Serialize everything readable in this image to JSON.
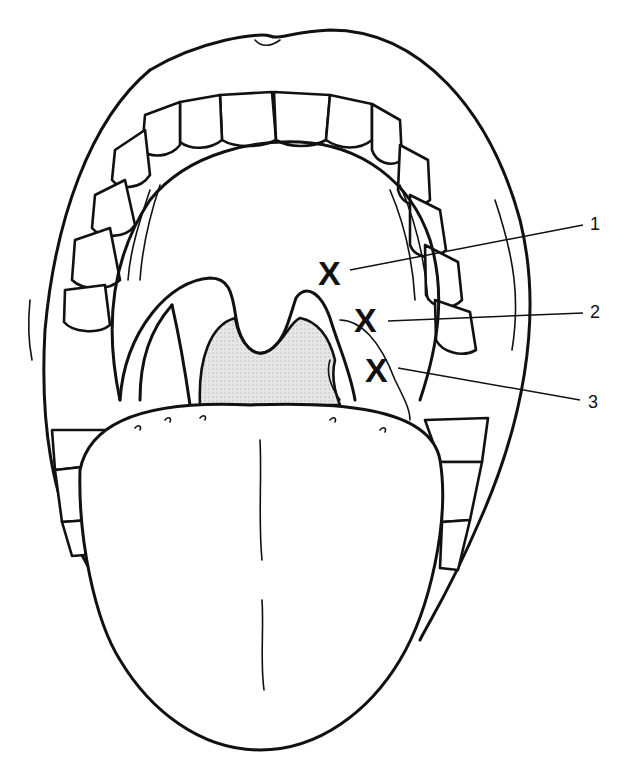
{
  "figure": {
    "colors": {
      "line": "#111111",
      "background": "#ffffff",
      "throat_fill": "#dedede"
    },
    "markers": [
      {
        "symbol": "X",
        "label": "1"
      },
      {
        "symbol": "X",
        "label": "2"
      },
      {
        "symbol": "X",
        "label": "3"
      }
    ]
  }
}
